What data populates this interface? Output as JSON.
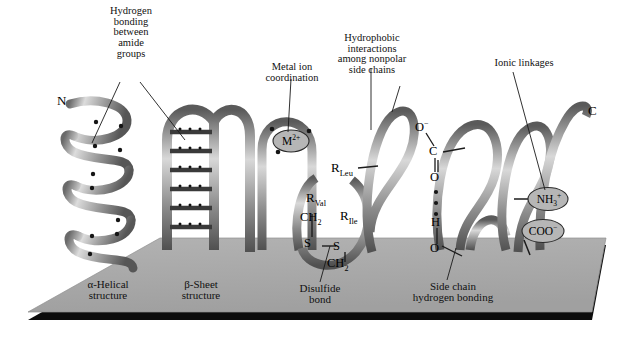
{
  "figure": {
    "title_visible": false,
    "colors": {
      "background": "#ffffff",
      "platform": "#a9a9a9",
      "platform_edge": "#0a0a0a",
      "ribbon_light": "#e2e2e2",
      "ribbon_mid": "#9a9a9a",
      "ribbon_dark": "#4c4c4c",
      "text": "#111111",
      "badge_fill": "#b4b4b4",
      "badge_stroke": "#2b2b2b",
      "leader_line": "#1a1a1a"
    }
  },
  "callouts": [
    {
      "id": "hydrogen-bonding-amide",
      "lines": [
        "Hydrogen",
        "bonding",
        "between",
        "amide",
        "groups"
      ]
    },
    {
      "id": "metal-ion-coordination",
      "lines": [
        "Metal ion",
        "coordination"
      ]
    },
    {
      "id": "hydrophobic-interactions",
      "lines": [
        "Hydrophobic",
        "interactions",
        "among nonpolar",
        "side chains"
      ]
    },
    {
      "id": "ionic-linkages",
      "lines": [
        "Ionic linkages"
      ]
    }
  ],
  "base_labels": [
    {
      "id": "alpha-helical-structure",
      "lines": [
        "α-Helical",
        "structure"
      ]
    },
    {
      "id": "beta-sheet-structure",
      "lines": [
        "β-Sheet",
        "structure"
      ]
    },
    {
      "id": "disulfide-bond",
      "lines": [
        "Disulfide",
        "bond"
      ]
    },
    {
      "id": "side-chain-hydrogen-bonding",
      "lines": [
        "Side chain",
        "hydrogen bonding"
      ]
    }
  ],
  "termini": {
    "n_terminus": "N",
    "c_terminus": "C"
  },
  "side_chains": {
    "r_leu": {
      "symbol": "R",
      "subscript": "Leu"
    },
    "r_val": {
      "symbol": "R",
      "subscript": "Val"
    },
    "r_ile": {
      "symbol": "R",
      "subscript": "Ile"
    }
  },
  "disulfide_chem": {
    "ch2_upper": {
      "text": "CH",
      "sub": "2"
    },
    "s_left": "S",
    "s_right": "S",
    "ch2_lower": {
      "text": "CH",
      "sub": "2"
    }
  },
  "hbond_chem": {
    "o_minus": {
      "text": "O",
      "sup": "−"
    },
    "carbon": "C",
    "o_carbonyl": "O",
    "h_donor": "H",
    "o_hydroxyl": "O"
  },
  "badges": [
    {
      "id": "metal-ion",
      "text": "M",
      "sup": "2+"
    },
    {
      "id": "ammonium-group",
      "text": "NH",
      "sub": "3",
      "sup": "+"
    },
    {
      "id": "carboxylate-group",
      "text": "COO",
      "sup": "−"
    }
  ]
}
